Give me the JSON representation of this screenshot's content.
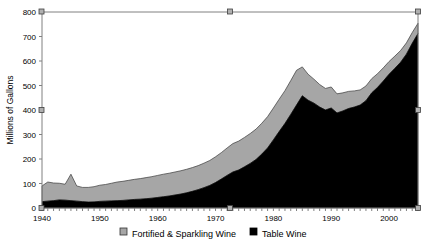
{
  "chart_data": {
    "type": "area",
    "stacked": true,
    "title": "",
    "xlabel": "",
    "ylabel": "Millions of Gallons",
    "ylim": [
      0,
      800
    ],
    "ytick_values": [
      0,
      100,
      200,
      300,
      400,
      500,
      600,
      700,
      800
    ],
    "ytick_labels": [
      "0",
      "100",
      "200",
      "300",
      "400",
      "500",
      "600",
      "700",
      "800"
    ],
    "xlim": [
      1940,
      2005
    ],
    "xtick_labels": [
      "1940",
      "1950",
      "1960",
      "1970",
      "1980",
      "1990",
      "2000"
    ],
    "xtick_values": [
      1940,
      1950,
      1960,
      1970,
      1980,
      1990,
      2000
    ],
    "grid": false,
    "legend_position": "bottom",
    "x": [
      1940,
      1941,
      1942,
      1943,
      1944,
      1945,
      1946,
      1947,
      1948,
      1949,
      1950,
      1951,
      1952,
      1953,
      1954,
      1955,
      1956,
      1957,
      1958,
      1959,
      1960,
      1961,
      1962,
      1963,
      1964,
      1965,
      1966,
      1967,
      1968,
      1969,
      1970,
      1971,
      1972,
      1973,
      1974,
      1975,
      1976,
      1977,
      1978,
      1979,
      1980,
      1981,
      1982,
      1983,
      1984,
      1985,
      1986,
      1987,
      1988,
      1989,
      1990,
      1991,
      1992,
      1993,
      1994,
      1995,
      1996,
      1997,
      1998,
      1999,
      2000,
      2001,
      2002,
      2003,
      2004,
      2005
    ],
    "series": [
      {
        "name": "Table Wine",
        "color": "#000000",
        "values": [
          26,
          28,
          30,
          33,
          32,
          30,
          28,
          26,
          24,
          25,
          27,
          28,
          29,
          30,
          31,
          33,
          35,
          36,
          38,
          40,
          43,
          46,
          49,
          53,
          57,
          62,
          68,
          75,
          83,
          92,
          104,
          118,
          133,
          147,
          155,
          168,
          182,
          198,
          220,
          245,
          278,
          312,
          345,
          382,
          420,
          458,
          440,
          428,
          412,
          400,
          408,
          388,
          396,
          406,
          412,
          420,
          438,
          470,
          492,
          518,
          546,
          570,
          595,
          628,
          672,
          712
        ]
      },
      {
        "name": "Fortified & Sparkling Wine",
        "color": "#a6a6a6",
        "values": [
          64,
          78,
          72,
          68,
          65,
          108,
          62,
          58,
          60,
          62,
          66,
          68,
          72,
          76,
          78,
          80,
          82,
          84,
          86,
          88,
          90,
          92,
          93,
          94,
          95,
          96,
          97,
          98,
          100,
          102,
          105,
          108,
          112,
          116,
          118,
          120,
          122,
          124,
          126,
          128,
          130,
          132,
          134,
          138,
          142,
          118,
          106,
          98,
          92,
          88,
          86,
          78,
          74,
          70,
          66,
          62,
          60,
          58,
          56,
          54,
          52,
          50,
          48,
          46,
          44,
          42
        ]
      }
    ],
    "legend": [
      {
        "label": "Fortified & Sparkling Wine",
        "marker": "gray-square",
        "color": "#a6a6a6"
      },
      {
        "label": "Table Wine",
        "marker": "black-square",
        "color": "#000000"
      }
    ],
    "colors": {
      "table_wine": "#000000",
      "fortified_sparkling": "#a6a6a6",
      "axis": "#808080",
      "text": "#000000",
      "background": "#ffffff"
    }
  },
  "selection": {
    "handles_visible": true,
    "handle_color": "#b0b0b0"
  }
}
